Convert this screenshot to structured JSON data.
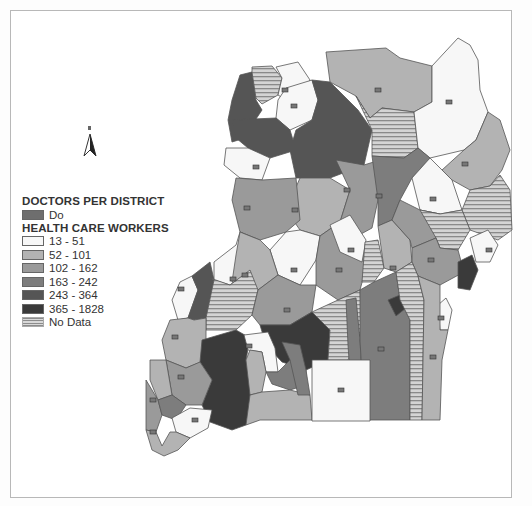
{
  "map": {
    "title": "Uganda health care workers and doctors per district",
    "north_arrow": {
      "label": "N"
    },
    "legend": {
      "doctors_title": "DOCTORS PER DISTRICT",
      "doctors_item": {
        "label": "Do",
        "color": "#6e6e6e"
      },
      "hcw_title": "HEALTH CARE WORKERS",
      "classes": [
        {
          "label": "13 - 51",
          "color": "#f7f7f7"
        },
        {
          "label": "52 - 101",
          "color": "#b3b3b3"
        },
        {
          "label": "102 - 162",
          "color": "#9a9a9a"
        },
        {
          "label": "163 - 242",
          "color": "#7d7d7d"
        },
        {
          "label": "243 - 364",
          "color": "#555555"
        },
        {
          "label": "365 - 1828",
          "color": "#3a3a3a"
        },
        {
          "label": "No Data",
          "color": "hatch"
        }
      ]
    }
  }
}
